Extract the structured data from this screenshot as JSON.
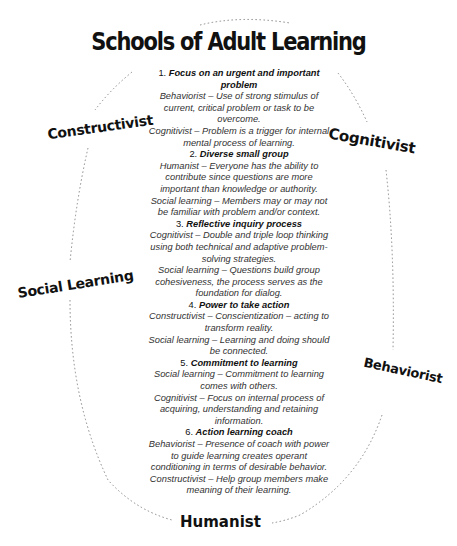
{
  "title": "Schools of Adult Learning",
  "schools": {
    "constructivist": "Constructivist",
    "cognitivist": "Cognitivist",
    "social_learning": "Social Learning",
    "behaviorist": "Behaviorist",
    "humanist": "Humanist"
  },
  "items": [
    {
      "number": "1.",
      "heading": "Focus on an urgent and important problem",
      "lines": [
        "Behaviorist – Use of strong stimulus of current, critical problem or task to be overcome.",
        "Cognitivist – Problem is a trigger for internal mental process of learning."
      ]
    },
    {
      "number": "2.",
      "heading": "Diverse small group",
      "lines": [
        "Humanist – Everyone has the ability to contribute since questions are more important than knowledge or authority.",
        "Social learning – Members may or may not be familiar with problem and/or context."
      ]
    },
    {
      "number": "3.",
      "heading": "Reflective inquiry process",
      "lines": [
        "Cognitivist – Double and triple loop thinking using both technical and adaptive problem-solving strategies.",
        "Social learning – Questions build group cohesiveness, the process serves as the foundation for dialog."
      ]
    },
    {
      "number": "4.",
      "heading": "Power to take action",
      "lines": [
        "Constructivist – Conscientization – acting to transform reality.",
        "Social learning – Learning and doing should be connected."
      ]
    },
    {
      "number": "5.",
      "heading": "Commitment to learning",
      "lines": [
        "Social learning – Commitment to learning comes with others.",
        "Cognitivist – Focus on internal process of acquiring, understanding and retaining information."
      ]
    },
    {
      "number": "6.",
      "heading": "Action learning coach",
      "lines": [
        "Behaviorist – Presence of coach with power to guide learning creates operant conditioning in terms of desirable behavior.",
        "Constructivist – Help group members make meaning of their learning."
      ]
    }
  ]
}
